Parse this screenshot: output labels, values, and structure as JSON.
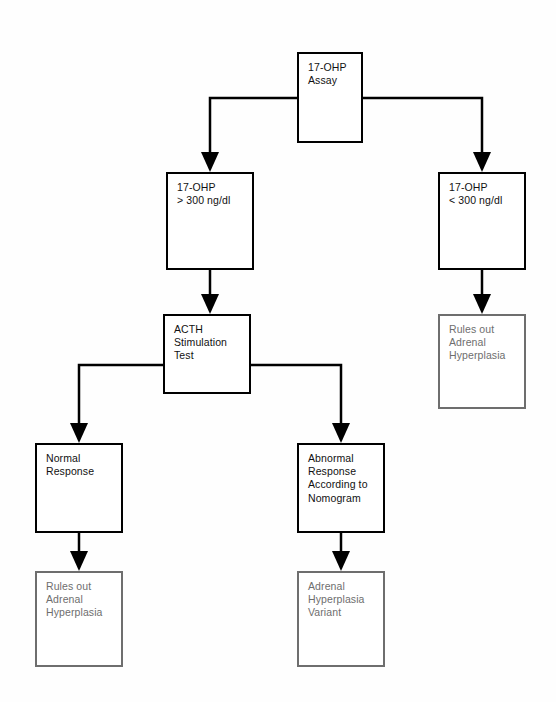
{
  "diagram": {
    "background_color": "#fefefe",
    "solid_stroke_color": "#000000",
    "muted_stroke_color": "#6e6e6e",
    "muted_text_color": "#6e6e6e",
    "text_color": "#111111"
  },
  "nodes": [
    {
      "id": "ohp-assay",
      "label": "17-OHP\nAssay",
      "style": "solid",
      "x": 297,
      "y": 52,
      "w": 66,
      "h": 91
    },
    {
      "id": "ohp-high",
      "label": "17-OHP\n> 300 ng/dl",
      "style": "solid",
      "x": 166,
      "y": 172,
      "w": 88,
      "h": 98
    },
    {
      "id": "ohp-low",
      "label": "17-OHP\n< 300 ng/dl",
      "style": "solid",
      "x": 438,
      "y": 172,
      "w": 88,
      "h": 98
    },
    {
      "id": "rules-out-right",
      "label": "Rules out\nAdrenal\nHyperplasia",
      "style": "muted",
      "x": 438,
      "y": 314,
      "w": 88,
      "h": 95
    },
    {
      "id": "acth-test",
      "label": "ACTH\nStimulation\nTest",
      "style": "solid",
      "x": 163,
      "y": 314,
      "w": 88,
      "h": 80
    },
    {
      "id": "normal-response",
      "label": "Normal\nResponse",
      "style": "solid",
      "x": 35,
      "y": 443,
      "w": 88,
      "h": 90
    },
    {
      "id": "abnormal-response",
      "label": "Abnormal\nResponse\nAccording to\nNomogram",
      "style": "solid",
      "x": 297,
      "y": 443,
      "w": 88,
      "h": 90
    },
    {
      "id": "rules-out-left-bottom",
      "label": "Rules out\nAdrenal\nHyperplasia",
      "style": "muted",
      "x": 35,
      "y": 571,
      "w": 88,
      "h": 96
    },
    {
      "id": "adrenal-variant",
      "label": "Adrenal\nHyperplasia\nVariant",
      "style": "muted",
      "x": 297,
      "y": 571,
      "w": 88,
      "h": 96
    }
  ],
  "connectors": [
    {
      "id": "assay-to-high",
      "from": "ohp-assay",
      "to": "ohp-high",
      "kind": "elbow-left"
    },
    {
      "id": "assay-to-low",
      "from": "ohp-assay",
      "to": "ohp-low",
      "kind": "elbow-right"
    },
    {
      "id": "high-to-acth",
      "from": "ohp-high",
      "to": "acth-test",
      "kind": "straight-down"
    },
    {
      "id": "low-to-rulesout",
      "from": "ohp-low",
      "to": "rules-out-right",
      "kind": "straight-down"
    },
    {
      "id": "acth-to-normal",
      "from": "acth-test",
      "to": "normal-response",
      "kind": "elbow-left"
    },
    {
      "id": "acth-to-abnormal",
      "from": "acth-test",
      "to": "abnormal-response",
      "kind": "elbow-right"
    },
    {
      "id": "normal-to-rulesout",
      "from": "normal-response",
      "to": "rules-out-left-bottom",
      "kind": "straight-down"
    },
    {
      "id": "abnormal-to-variant",
      "from": "abnormal-response",
      "to": "adrenal-variant",
      "kind": "straight-down"
    }
  ]
}
